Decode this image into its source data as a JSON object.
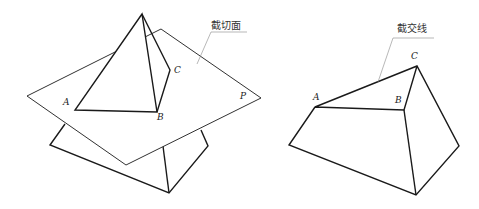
{
  "left_figure": {
    "callout": "截切面",
    "labels": {
      "A": "A",
      "B": "B",
      "C": "C",
      "P": "P"
    }
  },
  "right_figure": {
    "callout": "截交线",
    "labels": {
      "A": "A",
      "B": "B",
      "C": "C"
    }
  },
  "colors": {
    "stroke": "#1a1a1a",
    "leader": "#888888",
    "background": "#ffffff"
  }
}
